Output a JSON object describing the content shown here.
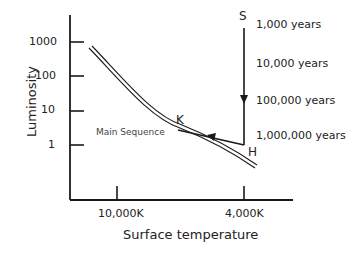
{
  "diagram": {
    "title": "",
    "y_axis": {
      "label": "Luminosity",
      "ticks": [
        "1000",
        "100",
        "10",
        "1"
      ]
    },
    "x_axis": {
      "label": "Surface temperature",
      "ticks": [
        "10,000K",
        "4,000K"
      ]
    },
    "curve_label": "Main Sequence",
    "points": {
      "S": "S",
      "H": "H",
      "K": "K"
    },
    "time_labels": [
      "1,000 years",
      "10,000 years",
      "100,000 years",
      "1,000,000 years"
    ],
    "colors": {
      "line": "#1a1a1a",
      "text": "#222222",
      "background": "#ffffff"
    }
  }
}
